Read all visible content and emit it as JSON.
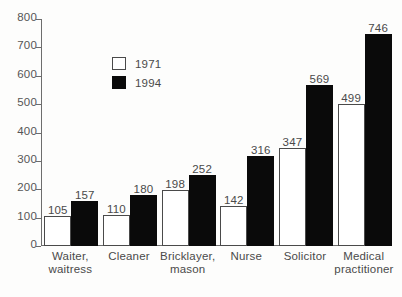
{
  "chart_data": {
    "type": "bar",
    "title": "",
    "subtitle": "",
    "xlabel": "",
    "ylabel": "",
    "ylim": [
      0,
      800
    ],
    "ytick_values": [
      0,
      100,
      200,
      300,
      400,
      500,
      600,
      700,
      800
    ],
    "ytick_labels": [
      "0",
      "100",
      "200",
      "300",
      "400",
      "500",
      "600",
      "700",
      "800"
    ],
    "grid": false,
    "legend_position": "upper-left-inset",
    "categories": [
      "Waiter, waitress",
      "Cleaner",
      "Bricklayer, mason",
      "Nurse",
      "Solicitor",
      "Medical practitioner"
    ],
    "category_lines": [
      [
        "Waiter,",
        "waitress"
      ],
      [
        "Cleaner",
        ""
      ],
      [
        "Bricklayer,",
        "mason"
      ],
      [
        "Nurse",
        ""
      ],
      [
        "Solicitor",
        ""
      ],
      [
        "Medical",
        "practitioner"
      ]
    ],
    "series": [
      {
        "name": "1971",
        "color": "#ffffff",
        "edge_color": "#4a4a4a",
        "values": [
          105,
          110,
          198,
          142,
          347,
          499
        ],
        "labels": [
          "105",
          "110",
          "198",
          "142",
          "347",
          "499"
        ]
      },
      {
        "name": "1994",
        "color": "#0a0a0a",
        "edge_color": "#0a0a0a",
        "values": [
          157,
          180,
          252,
          316,
          569,
          746
        ],
        "labels": [
          "157",
          "180",
          "252",
          "316",
          "569",
          "746"
        ]
      }
    ]
  },
  "legend": {
    "items": [
      {
        "label": "1971",
        "swatch": "white-square"
      },
      {
        "label": "1994",
        "swatch": "black-square"
      }
    ]
  },
  "colors": {
    "background": "#fdfdfc",
    "axis": "#6d6d6d",
    "text": "#4a4a4a",
    "series_1971": "#ffffff",
    "series_1994": "#0a0a0a"
  }
}
